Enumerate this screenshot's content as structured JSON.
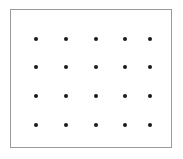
{
  "figure": {
    "title": "",
    "background_color": "#ffffff",
    "width": 183,
    "height": 159
  },
  "frame": {
    "name": "rectangular-border",
    "color": "#9a9a9a",
    "fill": "#ffffff",
    "border_width": 1,
    "left": 10,
    "top": 9,
    "width": 162,
    "height": 139
  },
  "chart_data": {
    "type": "scatter",
    "title": "",
    "xlabel": "",
    "ylabel": "",
    "grid": false,
    "legend": null,
    "marker": {
      "shape": "circle",
      "color": "#1a1a1a",
      "size": 4
    },
    "rows": 4,
    "columns": 5,
    "point_count": 20,
    "xlim": [
      10,
      172
    ],
    "ylim": [
      9,
      148
    ],
    "x_positions": [
      36,
      66,
      96,
      125,
      150
    ],
    "y_positions": [
      39,
      67,
      96,
      125
    ],
    "points": [
      {
        "x": 36,
        "y": 39
      },
      {
        "x": 66,
        "y": 39
      },
      {
        "x": 96,
        "y": 39
      },
      {
        "x": 125,
        "y": 39
      },
      {
        "x": 150,
        "y": 39
      },
      {
        "x": 36,
        "y": 67
      },
      {
        "x": 66,
        "y": 67
      },
      {
        "x": 96,
        "y": 67
      },
      {
        "x": 125,
        "y": 67
      },
      {
        "x": 150,
        "y": 67
      },
      {
        "x": 36,
        "y": 96
      },
      {
        "x": 66,
        "y": 96
      },
      {
        "x": 96,
        "y": 96
      },
      {
        "x": 125,
        "y": 96
      },
      {
        "x": 150,
        "y": 96
      },
      {
        "x": 36,
        "y": 125
      },
      {
        "x": 66,
        "y": 125
      },
      {
        "x": 96,
        "y": 125
      },
      {
        "x": 125,
        "y": 125
      },
      {
        "x": 150,
        "y": 125
      }
    ]
  }
}
